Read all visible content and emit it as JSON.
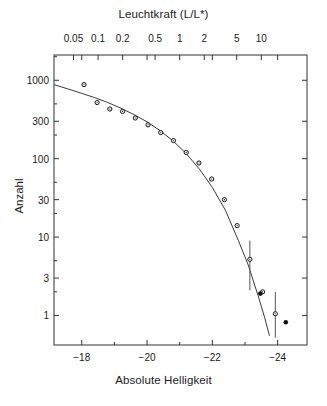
{
  "figure": {
    "top_axis_title": "Leuchtkraft (L/L*)",
    "bottom_axis_title": "Absolute Helligkeit",
    "y_axis_title": "Anzahl"
  },
  "chart_data": {
    "type": "scatter",
    "title": "",
    "xlabel": "Absolute Helligkeit",
    "ylabel": "Anzahl",
    "xlabel_top": "Leuchtkraft (L/L*)",
    "grid": false,
    "legend": null,
    "x_axis": {
      "label": "Absolute Helligkeit",
      "scale": "linear",
      "lim": [
        -17.15,
        -24.9
      ],
      "ticks": [
        -18,
        -20,
        -22,
        -24
      ],
      "ticklabels": [
        "−18",
        "−20",
        "−22",
        "−24"
      ],
      "minor_ticks": [
        -19,
        -21,
        -23
      ]
    },
    "x_axis_top": {
      "label": "Leuchtkraft (L/L*)",
      "scale": "log",
      "ticks": [
        0.05,
        0.1,
        0.2,
        0.5,
        1,
        2,
        5,
        10
      ],
      "ticklabels": [
        "0.05",
        "0.1",
        "0.2",
        "0.5",
        "1",
        "2",
        "5",
        "10"
      ]
    },
    "y_axis": {
      "label": "Anzahl",
      "scale": "log",
      "lim": [
        0.42,
        2100
      ],
      "ticks": [
        1,
        3,
        10,
        30,
        100,
        300,
        1000
      ],
      "ticklabels": [
        "1",
        "3",
        "10",
        "30",
        "100",
        "300",
        "1000"
      ]
    },
    "series": [
      {
        "name": "Beobachtete Anzahl",
        "marker": "open-circle",
        "x": [
          -18.07,
          -18.47,
          -18.86,
          -19.25,
          -19.64,
          -20.03,
          -20.42,
          -20.81,
          -21.2,
          -21.59,
          -21.98,
          -22.37,
          -22.76,
          -23.15,
          -23.54,
          -23.93
        ],
        "y": [
          880,
          520,
          430,
          400,
          330,
          270,
          215,
          170,
          120,
          88,
          55,
          30,
          14,
          5.2,
          2.0,
          1.05
        ]
      },
      {
        "name": "Fehlerbalken",
        "marker": "errorbar",
        "x": [
          -23.15,
          -23.93
        ],
        "y": [
          5.2,
          1.05
        ],
        "yerr_low": [
          2.1,
          0.52
        ],
        "yerr_high": [
          9.0,
          2.0
        ]
      },
      {
        "name": "Ausreisser",
        "marker": "filled-circle",
        "x": [
          -23.47,
          -24.25
        ],
        "y": [
          1.9,
          0.82
        ]
      }
    ],
    "fit_curve": {
      "name": "Schechter-Funktion",
      "style": "solid",
      "x": [
        -17.15,
        -17.6,
        -18.0,
        -18.4,
        -18.8,
        -19.2,
        -19.6,
        -20.0,
        -20.4,
        -20.8,
        -21.2,
        -21.6,
        -22.0,
        -22.4,
        -22.8,
        -23.1,
        -23.4,
        -23.6,
        -23.75
      ],
      "y": [
        880,
        770,
        680,
        600,
        520,
        440,
        365,
        295,
        228,
        168,
        116,
        74,
        43,
        22,
        9.0,
        4.4,
        1.8,
        0.95,
        0.55
      ]
    }
  }
}
